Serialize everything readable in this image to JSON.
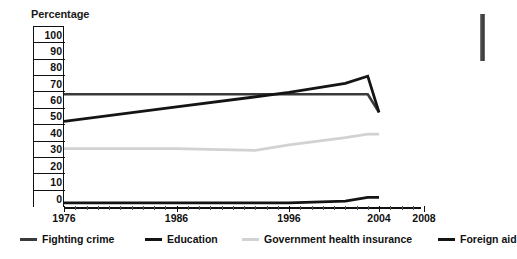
{
  "axis_title": "Percentage",
  "colors": {
    "fighting_crime": "#3a3a3a",
    "education": "#141414",
    "health_insurance": "#d2d2d2",
    "foreign_aid": "#141414",
    "axis": "#111111"
  },
  "y_axis": {
    "labels": [
      "100",
      "90",
      "80",
      "70",
      "60",
      "50",
      "40",
      "30",
      "20",
      "10",
      "0"
    ]
  },
  "x_axis": {
    "labels": [
      "1976",
      "1986",
      "1996",
      "2004",
      "2008"
    ]
  },
  "legend": {
    "items": [
      {
        "label": "Fighting crime",
        "color": "#3a3a3a"
      },
      {
        "label": "Education",
        "color": "#141414"
      },
      {
        "label": "Government health insurance",
        "color": "#d2d2d2"
      },
      {
        "label": "Foreign aid",
        "color": "#141414"
      }
    ]
  },
  "chart_data": {
    "type": "line",
    "title": "",
    "xlabel": "",
    "ylabel": "Percentage",
    "xlim": [
      1976,
      2008
    ],
    "ylim": [
      0,
      100
    ],
    "grid": false,
    "legend_position": "bottom",
    "x_ticks": [
      1976,
      1986,
      1996,
      2004,
      2008
    ],
    "y_ticks": [
      0,
      10,
      20,
      30,
      40,
      50,
      60,
      70,
      80,
      90,
      100
    ],
    "series": [
      {
        "name": "Fighting crime",
        "color": "#3a3a3a",
        "x": [
          1976,
          1986,
          1996,
          2001,
          2003
        ],
        "values": [
          62,
          62,
          62,
          62,
          62
        ]
      },
      {
        "name": "Education",
        "color": "#141414",
        "x": [
          1976,
          1986,
          1996,
          2001,
          2003
        ],
        "values": [
          47,
          55,
          63,
          68,
          72
        ]
      },
      {
        "name": "Government health insurance",
        "color": "#d2d2d2",
        "x": [
          1976,
          1986,
          1993,
          1996,
          2001,
          2003
        ],
        "values": [
          32,
          32,
          31,
          34,
          38,
          40
        ]
      },
      {
        "name": "Foreign aid",
        "color": "#141414",
        "x": [
          1976,
          1986,
          1996,
          2001,
          2003
        ],
        "values": [
          2,
          2,
          2,
          3,
          5
        ]
      }
    ],
    "series_endpoints": [
      {
        "name": "Fighting crime",
        "x": 2004,
        "value": 52
      },
      {
        "name": "Education",
        "x": 2004,
        "value": 52
      },
      {
        "name": "Government health insurance",
        "x": 2004,
        "value": 40
      },
      {
        "name": "Foreign aid",
        "x": 2004,
        "value": 5
      }
    ]
  }
}
